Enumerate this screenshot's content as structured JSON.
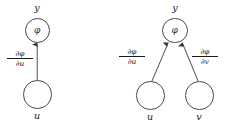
{
  "figure": {
    "background_color": "#ffffff",
    "stroke_color": "#4a4a4a",
    "text_color": "#1a1a1a"
  },
  "diagrams": [
    {
      "id": "single-variable",
      "nodes": [
        {
          "name": "phi-node",
          "label": "φ",
          "outer_label": "y"
        },
        {
          "name": "u-node",
          "label": "",
          "outer_label": "u"
        }
      ],
      "edges": [
        {
          "name": "edge-u-to-phi",
          "from": "u",
          "to": "φ",
          "derivative_numerator": "∂φ",
          "derivative_denominator": "∂u"
        }
      ]
    },
    {
      "id": "two-variable",
      "nodes": [
        {
          "name": "phi-node",
          "label": "φ",
          "outer_label": "y"
        },
        {
          "name": "u-node",
          "label": "",
          "outer_label": "u"
        },
        {
          "name": "v-node",
          "label": "",
          "outer_label": "v"
        }
      ],
      "edges": [
        {
          "name": "edge-u-to-phi",
          "from": "u",
          "to": "φ",
          "derivative_numerator": "∂φ",
          "derivative_denominator": "∂u"
        },
        {
          "name": "edge-v-to-phi",
          "from": "v",
          "to": "φ",
          "derivative_numerator": "∂φ",
          "derivative_denominator": "∂v"
        }
      ]
    }
  ]
}
